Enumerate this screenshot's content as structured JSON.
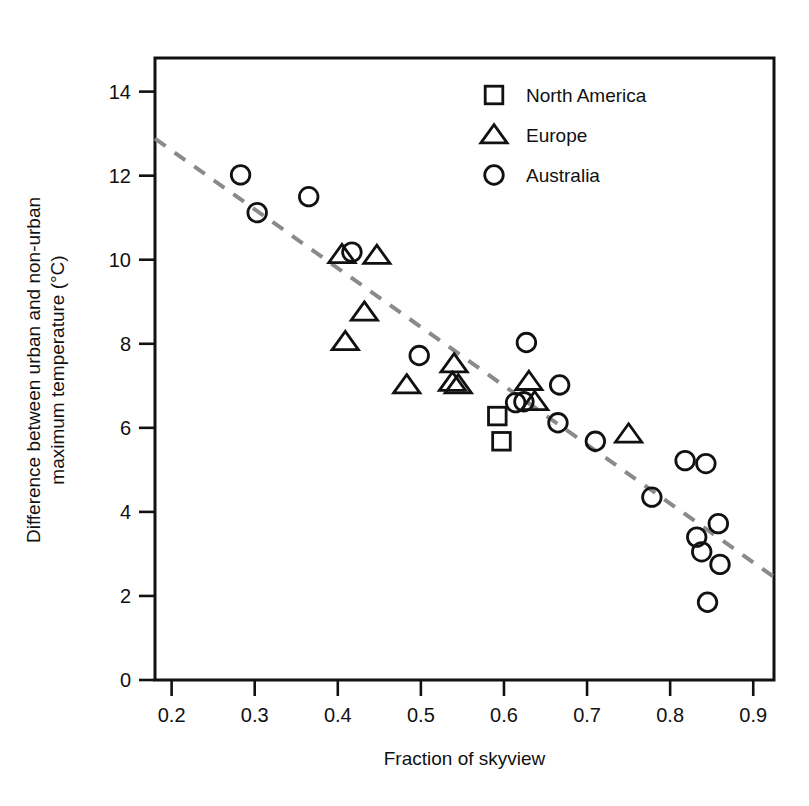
{
  "chart_data": {
    "type": "scatter",
    "title": "",
    "xlabel": "Fraction of skyview",
    "ylabel": "Difference between urban and non-urban maximum temperature (°C)",
    "ylabel_line1": "Difference between urban and non-urban",
    "ylabel_line2": "maximum temperature (°C)",
    "xlim": [
      0.18,
      0.925
    ],
    "ylim": [
      0.0,
      14.8
    ],
    "xticks": [
      0.2,
      0.3,
      0.4,
      0.5,
      0.6,
      0.7,
      0.8,
      0.9
    ],
    "xtick_labels": [
      "0.2",
      "0.3",
      "0.4",
      "0.5",
      "0.6",
      "0.7",
      "0.8",
      "0.9"
    ],
    "yticks": [
      0,
      2,
      4,
      6,
      8,
      10,
      12,
      14
    ],
    "ytick_labels": [
      "0",
      "2",
      "4",
      "6",
      "8",
      "10",
      "12",
      "14"
    ],
    "grid": false,
    "legend_position": "top-right",
    "legend": [
      {
        "label": "North America",
        "marker": "square"
      },
      {
        "label": "Europe",
        "marker": "triangle"
      },
      {
        "label": "Australia",
        "marker": "circle"
      }
    ],
    "series": [
      {
        "name": "North America",
        "marker": "square",
        "color": "#111111",
        "points": [
          {
            "x": 0.592,
            "y": 6.28
          },
          {
            "x": 0.597,
            "y": 5.68
          }
        ]
      },
      {
        "name": "Europe",
        "marker": "triangle",
        "color": "#111111",
        "points": [
          {
            "x": 0.405,
            "y": 10.12
          },
          {
            "x": 0.447,
            "y": 10.1
          },
          {
            "x": 0.432,
            "y": 8.75
          },
          {
            "x": 0.409,
            "y": 8.05
          },
          {
            "x": 0.483,
            "y": 7.02
          },
          {
            "x": 0.54,
            "y": 7.52
          },
          {
            "x": 0.538,
            "y": 7.08
          },
          {
            "x": 0.545,
            "y": 7.02
          },
          {
            "x": 0.63,
            "y": 7.1
          },
          {
            "x": 0.637,
            "y": 6.62
          },
          {
            "x": 0.75,
            "y": 5.85
          }
        ]
      },
      {
        "name": "Australia",
        "marker": "circle",
        "color": "#111111",
        "points": [
          {
            "x": 0.283,
            "y": 12.02
          },
          {
            "x": 0.303,
            "y": 11.12
          },
          {
            "x": 0.365,
            "y": 11.5
          },
          {
            "x": 0.417,
            "y": 10.18
          },
          {
            "x": 0.498,
            "y": 7.72
          },
          {
            "x": 0.627,
            "y": 8.03
          },
          {
            "x": 0.614,
            "y": 6.6
          },
          {
            "x": 0.624,
            "y": 6.62
          },
          {
            "x": 0.667,
            "y": 7.02
          },
          {
            "x": 0.665,
            "y": 6.12
          },
          {
            "x": 0.71,
            "y": 5.68
          },
          {
            "x": 0.778,
            "y": 4.35
          },
          {
            "x": 0.818,
            "y": 5.22
          },
          {
            "x": 0.843,
            "y": 5.15
          },
          {
            "x": 0.832,
            "y": 3.4
          },
          {
            "x": 0.838,
            "y": 3.05
          },
          {
            "x": 0.858,
            "y": 3.72
          },
          {
            "x": 0.86,
            "y": 2.75
          },
          {
            "x": 0.845,
            "y": 1.85
          }
        ]
      }
    ],
    "trendline": {
      "style": "dashed",
      "color": "#8a8a8a",
      "x_start": 0.18,
      "y_start": 12.88,
      "x_end": 0.925,
      "y_end": 2.45
    }
  }
}
